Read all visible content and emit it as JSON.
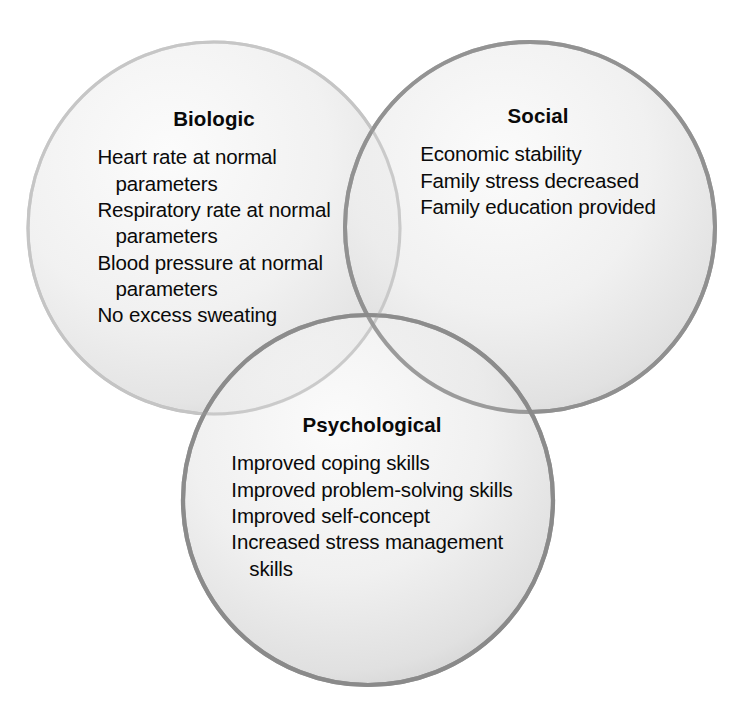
{
  "diagram": {
    "type": "venn",
    "title": "",
    "set_count": 3,
    "background_color": "#ffffff",
    "text_color": "#000000",
    "sets": [
      {
        "id": "biologic",
        "label": "Biologic",
        "fill_color": "#e9e9e9",
        "stroke_color": "#c8c8c8",
        "center_x": 214,
        "center_y": 228,
        "radius": 186,
        "items": [
          {
            "line": "Heart rate at normal",
            "cont": "parameters"
          },
          {
            "line": "Respiratory rate at normal",
            "cont": "parameters"
          },
          {
            "line": "Blood pressure at normal",
            "cont": "parameters"
          },
          {
            "line": "No excess sweating",
            "cont": ""
          }
        ]
      },
      {
        "id": "social",
        "label": "Social",
        "fill_color": "#e0e0e0",
        "stroke_color": "#a6a6a6",
        "center_x": 530,
        "center_y": 227,
        "radius": 185,
        "items": [
          {
            "line": "Economic stability",
            "cont": ""
          },
          {
            "line": "Family stress decreased",
            "cont": ""
          },
          {
            "line": "Family education provided",
            "cont": ""
          }
        ]
      },
      {
        "id": "psychological",
        "label": "Psychological",
        "fill_color": "#dcdcdc",
        "stroke_color": "#9c9c9c",
        "center_x": 368,
        "center_y": 500,
        "radius": 185,
        "items": [
          {
            "line": "Improved coping skills",
            "cont": ""
          },
          {
            "line": "Improved problem-solving skills",
            "cont": ""
          },
          {
            "line": "Improved self-concept",
            "cont": ""
          },
          {
            "line": "Increased stress management",
            "cont": "skills"
          }
        ]
      }
    ]
  }
}
